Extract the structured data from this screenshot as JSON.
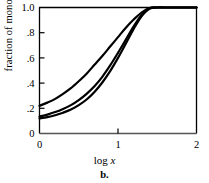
{
  "figure": {
    "panel_caption": "b.",
    "xlabel_prefix": "log ",
    "xlabel_var": "x",
    "ylabel": "fraction of monomer"
  },
  "chart_data": {
    "type": "line",
    "title": "",
    "subtitle": "",
    "xlabel": "log x",
    "ylabel": "fraction of monomer",
    "panel_label": "b.",
    "xlim": [
      0,
      2
    ],
    "ylim": [
      0,
      1.0
    ],
    "xticks": [
      0,
      1,
      2
    ],
    "xticklabels": [
      "0",
      "1",
      "2"
    ],
    "yticks": [
      0,
      0.2,
      0.4,
      0.6,
      0.8,
      1.0
    ],
    "yticklabels": [
      "0",
      ".2",
      ".4",
      ".6",
      ".8",
      "1.0"
    ],
    "grid": false,
    "legend": "none",
    "line_color": "#000000",
    "line_width": 2.2,
    "series": [
      {
        "name": "curve-1-upper",
        "x": [
          0.0,
          0.1,
          0.2,
          0.3,
          0.4,
          0.5,
          0.6,
          0.7,
          0.8,
          0.9,
          1.0,
          1.1,
          1.2,
          1.3,
          1.4,
          1.5,
          1.6,
          1.7,
          1.8,
          1.9,
          2.0
        ],
        "y": [
          0.22,
          0.245,
          0.275,
          0.315,
          0.36,
          0.415,
          0.475,
          0.545,
          0.615,
          0.69,
          0.765,
          0.84,
          0.905,
          0.96,
          0.995,
          1.0,
          1.0,
          1.0,
          1.0,
          1.0,
          1.0
        ]
      },
      {
        "name": "curve-2-middle",
        "x": [
          0.0,
          0.1,
          0.2,
          0.3,
          0.4,
          0.5,
          0.6,
          0.7,
          0.8,
          0.9,
          1.0,
          1.1,
          1.2,
          1.3,
          1.4,
          1.5,
          1.6,
          1.7,
          1.8,
          1.9,
          2.0
        ],
        "y": [
          0.135,
          0.15,
          0.17,
          0.195,
          0.225,
          0.265,
          0.315,
          0.375,
          0.45,
          0.54,
          0.64,
          0.745,
          0.85,
          0.94,
          0.995,
          1.0,
          1.0,
          1.0,
          1.0,
          1.0,
          1.0
        ]
      },
      {
        "name": "curve-3-lower",
        "x": [
          0.0,
          0.1,
          0.2,
          0.3,
          0.4,
          0.5,
          0.6,
          0.7,
          0.8,
          0.9,
          1.0,
          1.1,
          1.2,
          1.3,
          1.4,
          1.5,
          1.6,
          1.7,
          1.8,
          1.9,
          2.0
        ],
        "y": [
          0.12,
          0.13,
          0.145,
          0.165,
          0.19,
          0.225,
          0.27,
          0.33,
          0.405,
          0.495,
          0.6,
          0.715,
          0.83,
          0.93,
          0.99,
          1.0,
          1.0,
          1.0,
          1.0,
          1.0,
          1.0
        ]
      }
    ]
  }
}
